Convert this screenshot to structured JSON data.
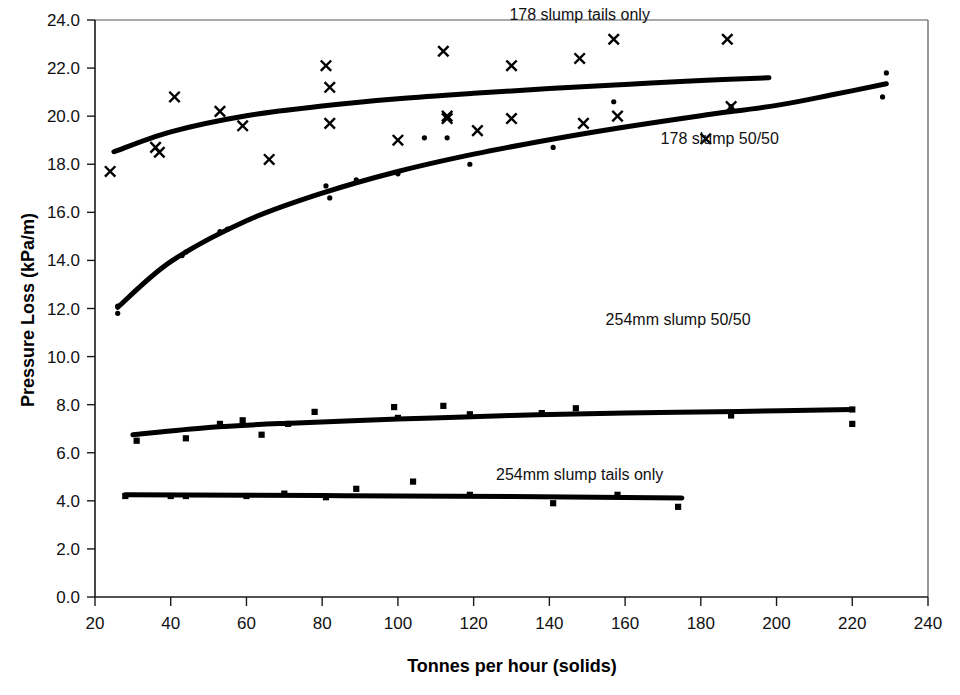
{
  "chart_data": {
    "type": "scatter",
    "title": "",
    "xlabel": "Tonnes per hour  (solids)",
    "ylabel": "Pressure Loss (kPa/m)",
    "xlim": [
      20,
      240
    ],
    "ylim": [
      0.0,
      24.0
    ],
    "xticks": [
      20,
      40,
      60,
      80,
      100,
      120,
      140,
      160,
      180,
      200,
      220,
      240
    ],
    "xtick_labels": [
      "20",
      "40",
      "60",
      "80",
      "100",
      "120",
      "140",
      "160",
      "180",
      "200",
      "220",
      "240"
    ],
    "yticks": [
      0.0,
      2.0,
      4.0,
      6.0,
      8.0,
      10.0,
      12.0,
      14.0,
      16.0,
      18.0,
      20.0,
      22.0,
      24.0
    ],
    "ytick_labels": [
      "0.0",
      "2.0",
      "4.0",
      "6.0",
      "8.0",
      "10.0",
      "12.0",
      "14.0",
      "16.0",
      "18.0",
      "20.0",
      "22.0",
      "24.0"
    ],
    "grid": false,
    "legend_position": "inline-annotations",
    "series": [
      {
        "name": "178 slump tails only",
        "marker": "cross",
        "annotation_label": "178 slump tails only",
        "annotation_x": 148,
        "annotation_y": 24.0,
        "points": [
          {
            "x": 24,
            "y": 17.7
          },
          {
            "x": 36,
            "y": 18.7
          },
          {
            "x": 37,
            "y": 18.5
          },
          {
            "x": 41,
            "y": 20.8
          },
          {
            "x": 53,
            "y": 20.2
          },
          {
            "x": 59,
            "y": 19.6
          },
          {
            "x": 66,
            "y": 18.2
          },
          {
            "x": 81,
            "y": 22.1
          },
          {
            "x": 82,
            "y": 21.2
          },
          {
            "x": 82,
            "y": 19.7
          },
          {
            "x": 100,
            "y": 19.0
          },
          {
            "x": 112,
            "y": 22.7
          },
          {
            "x": 113,
            "y": 20.0
          },
          {
            "x": 113,
            "y": 19.9
          },
          {
            "x": 121,
            "y": 19.4
          },
          {
            "x": 130,
            "y": 22.1
          },
          {
            "x": 130,
            "y": 19.9
          },
          {
            "x": 148,
            "y": 22.4
          },
          {
            "x": 149,
            "y": 19.7
          },
          {
            "x": 157,
            "y": 23.2
          },
          {
            "x": 158,
            "y": 20.0
          },
          {
            "x": 187,
            "y": 23.2
          },
          {
            "x": 188,
            "y": 20.4
          }
        ],
        "trend": [
          {
            "x": 25,
            "y": 18.52
          },
          {
            "x": 40,
            "y": 19.35
          },
          {
            "x": 60,
            "y": 20.02
          },
          {
            "x": 80,
            "y": 20.42
          },
          {
            "x": 100,
            "y": 20.72
          },
          {
            "x": 120,
            "y": 20.95
          },
          {
            "x": 140,
            "y": 21.15
          },
          {
            "x": 160,
            "y": 21.32
          },
          {
            "x": 180,
            "y": 21.48
          },
          {
            "x": 198,
            "y": 21.6
          }
        ]
      },
      {
        "name": "178 slump 50/50",
        "marker": "dot",
        "annotation_label": "178 slump 50/50",
        "annotation_marker": "cross",
        "annotation_x": 185,
        "annotation_y": 18.85,
        "points": [
          {
            "x": 26,
            "y": 12.1
          },
          {
            "x": 26,
            "y": 11.8
          },
          {
            "x": 43,
            "y": 14.2
          },
          {
            "x": 44,
            "y": 14.35
          },
          {
            "x": 53,
            "y": 15.2
          },
          {
            "x": 55,
            "y": 15.3
          },
          {
            "x": 81,
            "y": 17.1
          },
          {
            "x": 82,
            "y": 16.6
          },
          {
            "x": 89,
            "y": 17.35
          },
          {
            "x": 100,
            "y": 17.6
          },
          {
            "x": 107,
            "y": 19.1
          },
          {
            "x": 113,
            "y": 19.1
          },
          {
            "x": 119,
            "y": 18.0
          },
          {
            "x": 141,
            "y": 18.7
          },
          {
            "x": 157,
            "y": 20.6
          },
          {
            "x": 188,
            "y": 20.4
          },
          {
            "x": 229,
            "y": 21.8
          },
          {
            "x": 228,
            "y": 20.8
          }
        ],
        "trend": [
          {
            "x": 26,
            "y": 12.05
          },
          {
            "x": 40,
            "y": 13.95
          },
          {
            "x": 60,
            "y": 15.65
          },
          {
            "x": 80,
            "y": 16.8
          },
          {
            "x": 100,
            "y": 17.7
          },
          {
            "x": 120,
            "y": 18.42
          },
          {
            "x": 140,
            "y": 19.02
          },
          {
            "x": 160,
            "y": 19.55
          },
          {
            "x": 180,
            "y": 20.02
          },
          {
            "x": 200,
            "y": 20.45
          },
          {
            "x": 215,
            "y": 20.9
          },
          {
            "x": 229,
            "y": 21.35
          }
        ]
      },
      {
        "name": "254mm slump 50/50",
        "marker": "square",
        "annotation_label": "254mm slump 50/50",
        "annotation_x": 174,
        "annotation_y": 11.3,
        "points": [
          {
            "x": 31,
            "y": 6.5
          },
          {
            "x": 44,
            "y": 6.6
          },
          {
            "x": 53,
            "y": 7.2
          },
          {
            "x": 59,
            "y": 7.35
          },
          {
            "x": 64,
            "y": 6.75
          },
          {
            "x": 71,
            "y": 7.2
          },
          {
            "x": 78,
            "y": 7.7
          },
          {
            "x": 99,
            "y": 7.9
          },
          {
            "x": 100,
            "y": 7.45
          },
          {
            "x": 112,
            "y": 7.95
          },
          {
            "x": 119,
            "y": 7.6
          },
          {
            "x": 138,
            "y": 7.65
          },
          {
            "x": 147,
            "y": 7.85
          },
          {
            "x": 188,
            "y": 7.55
          },
          {
            "x": 220,
            "y": 7.8
          },
          {
            "x": 220,
            "y": 7.2
          }
        ],
        "trend": [
          {
            "x": 30,
            "y": 6.75
          },
          {
            "x": 50,
            "y": 7.05
          },
          {
            "x": 70,
            "y": 7.22
          },
          {
            "x": 100,
            "y": 7.4
          },
          {
            "x": 130,
            "y": 7.55
          },
          {
            "x": 160,
            "y": 7.65
          },
          {
            "x": 190,
            "y": 7.72
          },
          {
            "x": 220,
            "y": 7.8
          }
        ]
      },
      {
        "name": "254mm slump tails only",
        "marker": "square",
        "annotation_label": "254mm slump tails only",
        "annotation_x": 148,
        "annotation_y": 4.85,
        "points": [
          {
            "x": 28,
            "y": 4.2
          },
          {
            "x": 40,
            "y": 4.2
          },
          {
            "x": 44,
            "y": 4.2
          },
          {
            "x": 60,
            "y": 4.2
          },
          {
            "x": 70,
            "y": 4.3
          },
          {
            "x": 81,
            "y": 4.15
          },
          {
            "x": 89,
            "y": 4.5
          },
          {
            "x": 104,
            "y": 4.8
          },
          {
            "x": 119,
            "y": 4.25
          },
          {
            "x": 141,
            "y": 3.9
          },
          {
            "x": 158,
            "y": 4.25
          },
          {
            "x": 174,
            "y": 3.75
          }
        ],
        "trend": [
          {
            "x": 28,
            "y": 4.25
          },
          {
            "x": 80,
            "y": 4.22
          },
          {
            "x": 130,
            "y": 4.18
          },
          {
            "x": 175,
            "y": 4.12
          }
        ]
      }
    ]
  },
  "axes": {
    "x_title": "Tonnes per hour  (solids)",
    "y_title": "Pressure Loss (kPa/m)"
  },
  "plot_geometry": {
    "left_px": 95,
    "right_px": 928,
    "top_px": 20,
    "bottom_px": 597
  }
}
